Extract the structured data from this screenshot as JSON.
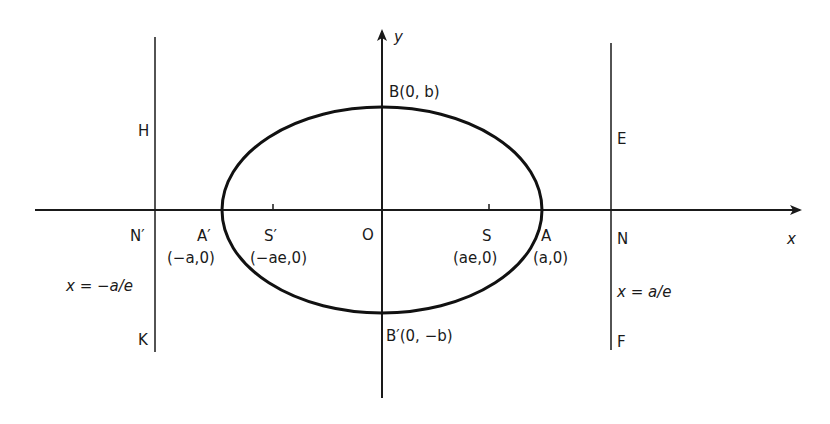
{
  "figure": {
    "type": "ellipse-with-directrices",
    "colors": {
      "ink": "#1a1a1a",
      "background": "#ffffff"
    }
  },
  "axes": {
    "x_label": "x",
    "y_label": "y",
    "origin_label": "O"
  },
  "ellipse": {
    "vertices": {
      "right": {
        "name": "A",
        "coords": "(a,0)"
      },
      "left": {
        "name": "A′",
        "coords": "(−a,0)"
      },
      "top": {
        "name": "B",
        "coords": "(0,b)",
        "full": "B(0, b)"
      },
      "bottom": {
        "name": "B′",
        "coords": "(0,−b)",
        "full": "B′(0, −b)"
      }
    },
    "foci": {
      "right": {
        "name": "S",
        "coords": "(ae,0)"
      },
      "left": {
        "name": "S′",
        "coords": "(−ae,0)"
      }
    }
  },
  "directrices": {
    "left": {
      "equation": "x = −a/e",
      "foot": "N′",
      "top_label": "H",
      "bottom_label": "K"
    },
    "right": {
      "equation": "x = a/e",
      "foot": "N",
      "top_label": "E",
      "bottom_label": "F"
    }
  }
}
